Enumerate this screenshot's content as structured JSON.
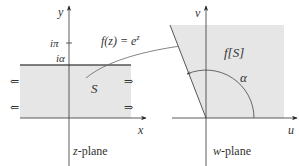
{
  "diagram": {
    "colors": {
      "shade": "#e6e6e6",
      "axis": "#333333",
      "boundary": "#555555",
      "curve": "#555555"
    },
    "z_plane": {
      "label_var": "z",
      "label_suffix": "-plane",
      "x_axis_label": "x",
      "y_axis_label": "y",
      "tick_ipi": "iπ",
      "tick_ialpha": "iα",
      "region_label": "S",
      "left_arrows": "⇐",
      "right_arrows": "⇒"
    },
    "mapping": {
      "label": "f(z) = e",
      "exponent": "z"
    },
    "w_plane": {
      "label_var": "w",
      "label_suffix": "-plane",
      "u_axis_label": "u",
      "v_axis_label": "v",
      "region_label": "f[S]",
      "angle_label": "α"
    }
  }
}
